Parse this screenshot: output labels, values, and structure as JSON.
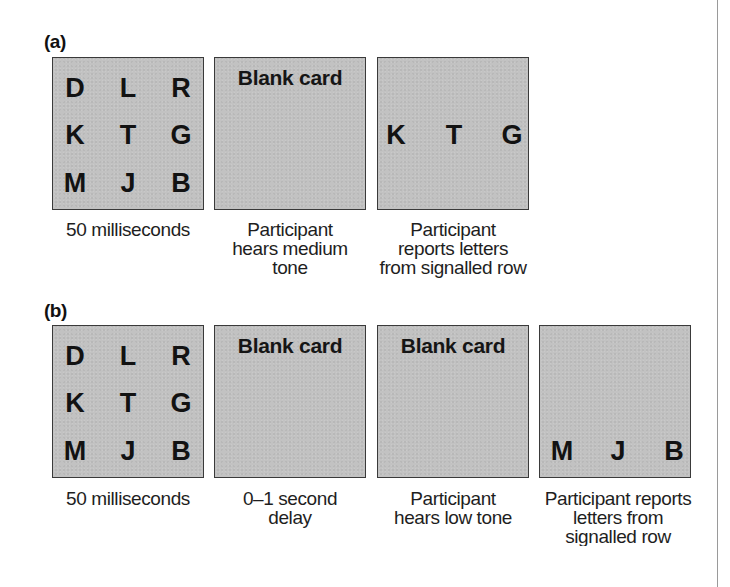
{
  "figure": {
    "panels": [
      {
        "label": "(a)",
        "cards": [
          {
            "type": "letters",
            "rows": [
              [
                "D",
                "L",
                "R"
              ],
              [
                "K",
                "T",
                "G"
              ],
              [
                "M",
                "J",
                "B"
              ]
            ],
            "caption": [
              "50 milliseconds"
            ]
          },
          {
            "type": "blank",
            "title": "Blank card",
            "caption": [
              "Participant",
              "hears medium",
              "tone"
            ]
          },
          {
            "type": "report",
            "rows": [
              [
                "K",
                "T",
                "G"
              ]
            ],
            "caption": [
              "Participant",
              "reports letters",
              "from signalled row"
            ]
          }
        ]
      },
      {
        "label": "(b)",
        "cards": [
          {
            "type": "letters",
            "rows": [
              [
                "D",
                "L",
                "R"
              ],
              [
                "K",
                "T",
                "G"
              ],
              [
                "M",
                "J",
                "B"
              ]
            ],
            "caption": [
              "50 milliseconds"
            ]
          },
          {
            "type": "blank",
            "title": "Blank card",
            "caption": [
              "0–1 second",
              "delay"
            ]
          },
          {
            "type": "blank",
            "title": "Blank card",
            "caption": [
              "Participant",
              "hears low tone"
            ]
          },
          {
            "type": "report",
            "rows": [
              [
                "M",
                "J",
                "B"
              ]
            ],
            "caption": [
              "Participant reports",
              "letters from",
              "signalled row"
            ]
          }
        ]
      }
    ],
    "colors": {
      "card_fill": "#c2c2c2",
      "card_border": "#3a3a3a",
      "text": "#151515",
      "rule": "#9a9a9a"
    }
  }
}
